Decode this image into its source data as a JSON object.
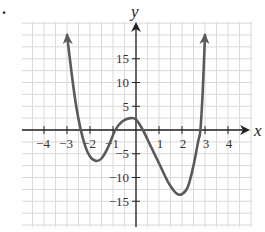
{
  "problem_marker": ".",
  "chart_data": {
    "type": "line",
    "title": "",
    "xlabel": "x",
    "ylabel": "y",
    "xlim": [
      -4.5,
      4.6
    ],
    "ylim": [
      -18.5,
      20
    ],
    "grid": true,
    "x_ticks": [
      -4,
      -3,
      -2,
      -1,
      1,
      2,
      3,
      4
    ],
    "x_tick_labels": [
      "−4",
      "−3",
      "−2",
      "−1",
      "1",
      "2",
      "3",
      "4"
    ],
    "y_ticks": [
      15,
      10,
      5,
      -5,
      -10,
      -15
    ],
    "y_tick_labels": [
      "15",
      "10",
      "5",
      "−5",
      "−10",
      "−15"
    ],
    "series": [
      {
        "name": "f(x)",
        "description": "quartic polynomial, both ends rising (arrows up)",
        "points": [
          [
            -3.0,
            20
          ],
          [
            -2.8,
            12
          ],
          [
            -2.6,
            5
          ],
          [
            -2.4,
            0
          ],
          [
            -2.2,
            -3.5
          ],
          [
            -2.0,
            -5.6
          ],
          [
            -1.75,
            -6.5
          ],
          [
            -1.5,
            -6.0
          ],
          [
            -1.2,
            -3.5
          ],
          [
            -0.9,
            0
          ],
          [
            -0.6,
            1.8
          ],
          [
            -0.25,
            2.5
          ],
          [
            0.0,
            2.2
          ],
          [
            0.3,
            0
          ],
          [
            0.6,
            -3.0
          ],
          [
            1.0,
            -7.0
          ],
          [
            1.4,
            -11.0
          ],
          [
            1.75,
            -13.3
          ],
          [
            2.0,
            -13.5
          ],
          [
            2.25,
            -12.0
          ],
          [
            2.5,
            -7.5
          ],
          [
            2.7,
            -2.5
          ],
          [
            2.8,
            0
          ],
          [
            2.9,
            8
          ],
          [
            3.0,
            20
          ]
        ],
        "zeros": [
          -2.4,
          -0.9,
          0.3,
          2.8
        ],
        "local_minima": [
          [
            -1.75,
            -6.5
          ],
          [
            2.0,
            -13.5
          ]
        ],
        "local_maxima": [
          [
            -0.25,
            2.5
          ]
        ],
        "color": "#5a5a5a"
      }
    ]
  },
  "colors": {
    "grid": "#d9d9d9",
    "axis": "#222222",
    "curve": "#5a5a5a"
  }
}
